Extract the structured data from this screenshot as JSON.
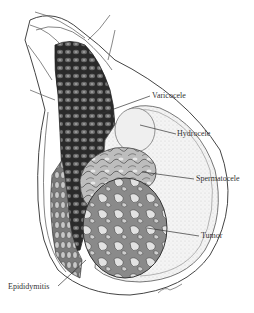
{
  "figure": {
    "labels": [
      {
        "id": "varicocele",
        "text": "Varicocele"
      },
      {
        "id": "hydrocele",
        "text": "Hydrocele"
      },
      {
        "id": "spermatocele",
        "text": "Spermatocele"
      },
      {
        "id": "tumor",
        "text": "Tumor"
      },
      {
        "id": "epididymitis",
        "text": "Epididymitis"
      }
    ],
    "signature": "F. Netter-style artist signature"
  }
}
